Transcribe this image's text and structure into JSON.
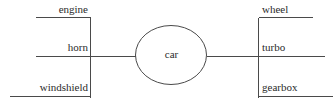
{
  "diagram": {
    "type": "entity-attribute-diagram",
    "style": {
      "line_color": "#4a4a4a",
      "text_color": "#2b2b2b",
      "background_color": "#ffffff"
    },
    "entity": {
      "name": "car",
      "shape": "ellipse"
    },
    "left_group": {
      "attributes": [
        {
          "label": "engine"
        },
        {
          "label": "horn"
        },
        {
          "label": "windshield"
        }
      ]
    },
    "right_group": {
      "attributes": [
        {
          "label": "wheel"
        },
        {
          "label": "turbo"
        },
        {
          "label": "gearbox"
        }
      ]
    },
    "connectors": [
      {
        "from": "horn",
        "to": "car"
      },
      {
        "from": "car",
        "to": "turbo"
      }
    ]
  }
}
